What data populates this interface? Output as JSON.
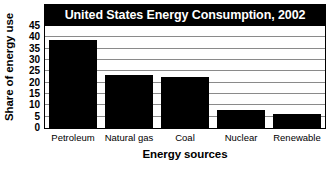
{
  "chart_data": {
    "type": "bar",
    "title": "United States Energy Consumption, 2002",
    "xlabel": "Energy sources",
    "ylabel": "Share of energy use",
    "categories": [
      "Petroleum",
      "Natural gas",
      "Coal",
      "Nuclear",
      "Renewable"
    ],
    "values": [
      39,
      23.5,
      22.5,
      8,
      6
    ],
    "ylim": [
      0,
      45
    ],
    "ytick_labels": [
      "0",
      "5",
      "10",
      "15",
      "20",
      "25",
      "30",
      "35",
      "40",
      "45"
    ],
    "ytick_values": [
      0,
      5,
      10,
      15,
      20,
      25,
      30,
      35,
      40,
      45
    ],
    "grid": true,
    "legend": "none",
    "colors": {
      "bar": "#000000",
      "title_banner": "#000000",
      "title_text": "#ffffff",
      "gridline": "#8a8a8a",
      "axis": "#000000",
      "plot_background": "#ffffff"
    }
  }
}
